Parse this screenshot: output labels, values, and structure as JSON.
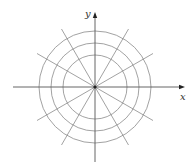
{
  "diagram": {
    "type": "polar-coordinate-grid",
    "center": {
      "x": 95,
      "y": 87
    },
    "circle_radii": [
      32,
      44,
      56
    ],
    "radial_angles_deg": [
      0,
      30,
      60,
      90,
      120,
      150,
      180,
      210,
      240,
      270,
      300,
      330
    ],
    "radial_length": 67,
    "colors": {
      "grid": "#8a8a8a",
      "axis": "#555555",
      "center_dot": "#222222"
    },
    "x_axis": {
      "label": "x",
      "from": 13,
      "to": 185
    },
    "y_axis": {
      "label": "y",
      "from": 162,
      "to": 12
    }
  }
}
